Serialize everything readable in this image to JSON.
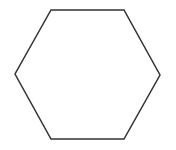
{
  "diagram": {
    "shape": "hexagon",
    "background": "#ffffff",
    "stroke_color": "#333333",
    "fill_color": "#ffffff",
    "stroke_width": 1.5,
    "vertices": [
      [
        51,
        10
      ],
      [
        124,
        10
      ],
      [
        160,
        75
      ],
      [
        124,
        139
      ],
      [
        51,
        139
      ],
      [
        15,
        74
      ]
    ]
  }
}
